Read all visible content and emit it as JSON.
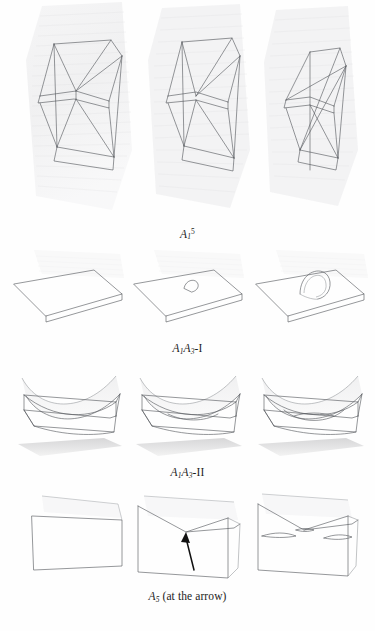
{
  "document": {
    "type": "mathematical-figure-plate",
    "background_color": "#fefefe",
    "ink_color": "#55585c",
    "accent_color": "#111111",
    "page_width": 375,
    "page_height": 631
  },
  "rows": [
    {
      "id": "row-a1-5",
      "caption": {
        "base": "A",
        "subscript": "1",
        "superscript": "5",
        "suffix": "",
        "plain_text": "A_1^5"
      },
      "panel_count": 3,
      "panel_description": "wireframe tetrahedral/prismatic frames on faint stippled background sheets",
      "panels": [
        {
          "label": "left",
          "note": "open quadrilateral prism wireframe with crossing diagonals"
        },
        {
          "label": "center",
          "note": "frame compressed, diagonals converge to a single node"
        },
        {
          "label": "right",
          "note": "frame narrowed, edges cross forming a pinch"
        }
      ]
    },
    {
      "id": "row-a1a3-I",
      "caption": {
        "base": "A",
        "subscript": "1",
        "base2": "A",
        "subscript2": "3",
        "suffix": "-I",
        "plain_text": "A_1A_3-I"
      },
      "panel_count": 3,
      "panel_description": "flat slanted plane sheets; a small arch (swallowtail lip) grows out of the plane",
      "panels": [
        {
          "label": "left",
          "note": "plain flat parallelogram sheet, no feature"
        },
        {
          "label": "center",
          "note": "small triangular lip emerging from the sheet"
        },
        {
          "label": "right",
          "note": "full arch/loop standing on the sheet"
        }
      ]
    },
    {
      "id": "row-a1a3-II",
      "caption": {
        "base": "A",
        "subscript": "1",
        "base2": "A",
        "subscript2": "3",
        "suffix": "-II",
        "plain_text": "A_1A_3-II"
      },
      "panel_count": 3,
      "panel_description": "parabolic valley surfaces above a stippled shadow plane, with intersecting ruled sheets",
      "panels": [
        {
          "label": "left",
          "note": "parabolic trough over shaded ground plane"
        },
        {
          "label": "center",
          "note": "trough touching the ruled sheet"
        },
        {
          "label": "right",
          "note": "trough penetrating the sheet, double curve visible"
        }
      ]
    },
    {
      "id": "row-a5",
      "caption": {
        "base": "A",
        "subscript": "5",
        "suffix": " (at the arrow)",
        "plain_text": "A_5 (at the arrow)"
      },
      "panel_count": 3,
      "panel_description": "quadrilateral surfaces developing a V-shaped crease; black arrow marks the A5 point",
      "annotation": {
        "kind": "arrow",
        "color": "#111111",
        "points_at": "A5 singular point on the crease",
        "in_panel": "center"
      },
      "panels": [
        {
          "label": "left",
          "note": "smooth quadrilateral sheet"
        },
        {
          "label": "center",
          "note": "V crease formed, arrow points up at the vertex"
        },
        {
          "label": "right",
          "note": "crease opened into two cusps with side slits"
        }
      ]
    }
  ]
}
